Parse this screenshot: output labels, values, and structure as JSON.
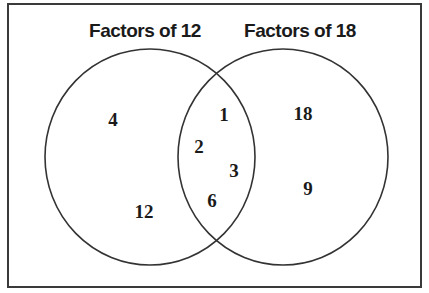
{
  "diagram": {
    "type": "venn",
    "sets": [
      {
        "label": "Factors of 12",
        "only": [
          "4",
          "12"
        ]
      },
      {
        "label": "Factors of 18",
        "only": [
          "18",
          "9"
        ]
      }
    ],
    "intersection": [
      "1",
      "2",
      "3",
      "6"
    ]
  },
  "labels": {
    "left_title": "Factors of 12",
    "right_title": "Factors of 18",
    "left_only": [
      "4",
      "12"
    ],
    "both": [
      "1",
      "2",
      "3",
      "6"
    ],
    "right_only": [
      "18",
      "9"
    ]
  },
  "colors": {
    "stroke": "#333333",
    "text": "#1a1a1a",
    "background": "#ffffff"
  }
}
